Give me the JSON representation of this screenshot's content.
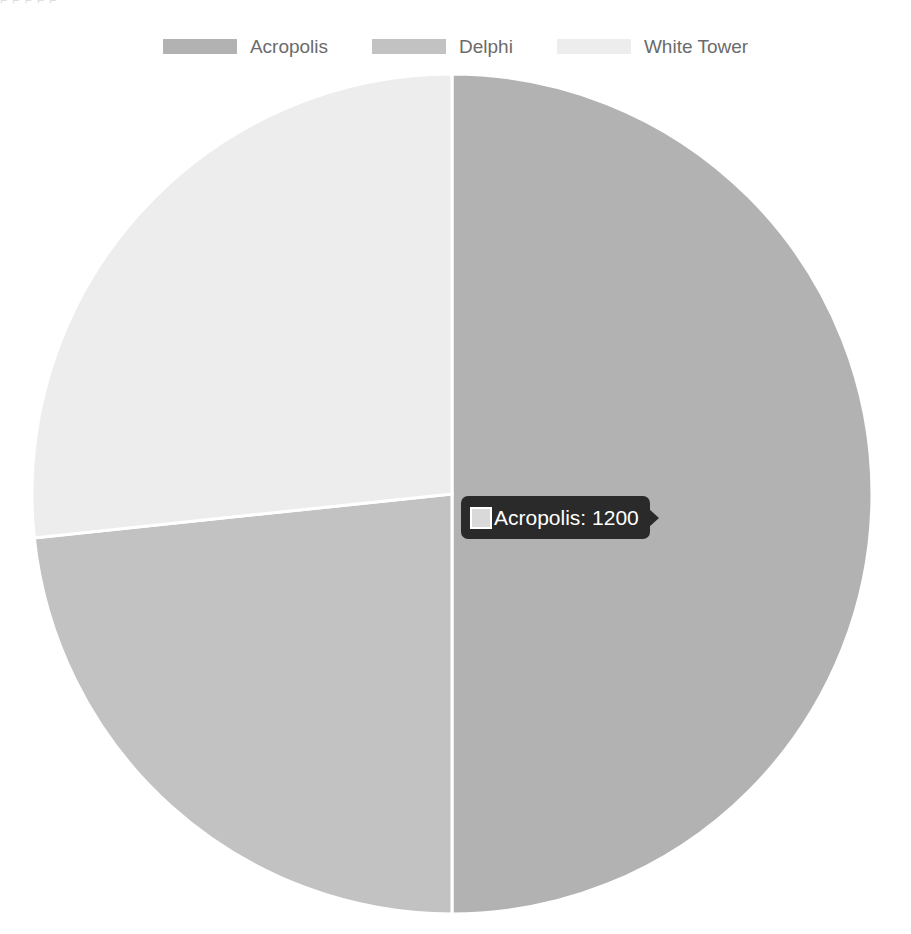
{
  "top_artifact": "⌐ ⌐  ⌐   ⌐  ⌐",
  "legend": {
    "position": "top",
    "items": [
      {
        "label": "Acropolis",
        "color": "#b2b2b2",
        "swatch_name": "legend-swatch-acropolis"
      },
      {
        "label": "Delphi",
        "color": "#c2c2c2",
        "swatch_name": "legend-swatch-delphi"
      },
      {
        "label": "White Tower",
        "color": "#ededed",
        "swatch_name": "legend-swatch-white-tower"
      }
    ]
  },
  "tooltip": {
    "visible": true,
    "series": "Acropolis",
    "value": "1200",
    "text": "Acropolis: 1200",
    "swatch_color": "#d9d9d9",
    "background": "#2a2a2a",
    "text_color": "#ffffff"
  },
  "chart_data": {
    "type": "pie",
    "title": "",
    "labels": [
      "Acropolis",
      "Delphi",
      "White Tower"
    ],
    "values": [
      1200,
      560,
      640
    ],
    "colors": [
      "#b2b2b2",
      "#c2c2c2",
      "#ededed"
    ],
    "total": 2400,
    "percentages": [
      50.0,
      23.3,
      26.7
    ],
    "legend_position": "top",
    "start_angle_deg": 0,
    "direction": "clockwise",
    "slice_border_color": "#ffffff",
    "slice_border_width": 3,
    "center_x": 452,
    "center_y": 494,
    "radius": 420,
    "highlighted_slice": "Acropolis",
    "grid": false,
    "xlabel": "",
    "ylabel": ""
  }
}
